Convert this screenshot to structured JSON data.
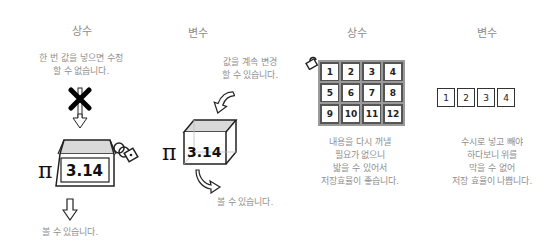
{
  "panels": [
    {
      "title": "상수",
      "description": "한 번 값을 넣으면 수정\n할 수 없습니다.",
      "symbol": "π",
      "value": "3.14",
      "footer": "볼 수 있습니다."
    },
    {
      "title": "변수",
      "description": "값을 계속 변경\n할 수 있습니다.",
      "symbol": "π",
      "value": "3.14",
      "footer": "볼 수 있습니다."
    },
    {
      "title": "상수",
      "grid": [
        "1",
        "2",
        "3",
        "4",
        "5",
        "6",
        "7",
        "8",
        "9",
        "10",
        "11",
        "12"
      ],
      "description": "내용을 다시 꺼낼\n필요가 없으니\n밟을 수 있어서\n저장효율이 좋습니다."
    },
    {
      "title": "변수",
      "row": [
        "1",
        "2",
        "3",
        "4"
      ],
      "description": "수시로 넣고 빼야\n하다보니 위를\n막을 수 없어\n저장 효율이 나쁩니다."
    }
  ],
  "colors": {
    "text": "#8a8a8a",
    "line": "#222222",
    "fill": "#d9d9d9"
  }
}
